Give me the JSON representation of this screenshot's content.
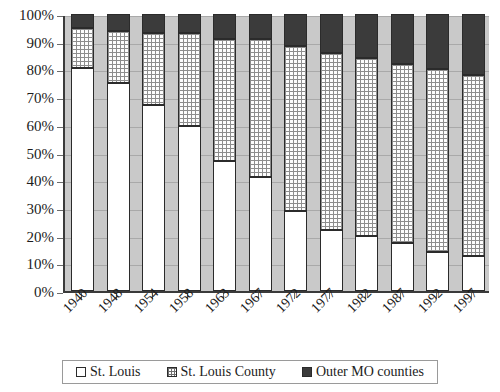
{
  "chart_data": {
    "type": "bar",
    "stacked": true,
    "stacked_mode": "percent",
    "title": "",
    "subtitle": "",
    "xlabel": "",
    "ylabel": "",
    "ylim": [
      0,
      100
    ],
    "ytick_labels": [
      "0%",
      "10%",
      "20%",
      "30%",
      "40%",
      "50%",
      "60%",
      "70%",
      "80%",
      "90%",
      "100%"
    ],
    "ytick_values": [
      0,
      10,
      20,
      30,
      40,
      50,
      60,
      70,
      80,
      90,
      100
    ],
    "grid": true,
    "legend_position": "bottom",
    "categories": [
      "1940",
      "1948",
      "1954",
      "1958",
      "1963",
      "1967",
      "1972",
      "1977",
      "1982",
      "1987",
      "1992",
      "1997"
    ],
    "series": [
      {
        "name": "St. Louis",
        "fill": "white",
        "color": "#ffffff",
        "values": [
          80.5,
          75.0,
          67.0,
          59.5,
          47.0,
          41.0,
          29.0,
          22.0,
          20.0,
          17.5,
          14.0,
          12.5
        ]
      },
      {
        "name": "St. Louis County",
        "fill": "grid",
        "color": "#fdfdfd",
        "values": [
          14.5,
          19.0,
          26.0,
          33.5,
          44.0,
          50.0,
          59.5,
          64.0,
          64.0,
          64.5,
          66.0,
          65.5
        ]
      },
      {
        "name": "Outer MO counties",
        "fill": "solid-dark",
        "color": "#3b3b3b",
        "values": [
          5.0,
          6.0,
          7.0,
          7.0,
          9.0,
          9.0,
          11.5,
          14.0,
          16.0,
          18.0,
          20.0,
          22.0
        ]
      }
    ]
  },
  "axes": {
    "y_ticks": [
      {
        "label": "0%",
        "value": 0
      },
      {
        "label": "10%",
        "value": 10
      },
      {
        "label": "20%",
        "value": 20
      },
      {
        "label": "30%",
        "value": 30
      },
      {
        "label": "40%",
        "value": 40
      },
      {
        "label": "50%",
        "value": 50
      },
      {
        "label": "60%",
        "value": 60
      },
      {
        "label": "70%",
        "value": 70
      },
      {
        "label": "80%",
        "value": 80
      },
      {
        "label": "90%",
        "value": 90
      },
      {
        "label": "100%",
        "value": 100
      }
    ],
    "x_ticks": [
      "1940",
      "1948",
      "1954",
      "1958",
      "1963",
      "1967",
      "1972",
      "1977",
      "1982",
      "1987",
      "1992",
      "1997"
    ]
  },
  "legend": {
    "items": [
      {
        "label": "St. Louis",
        "swatch": "white-square-icon"
      },
      {
        "label": "St. Louis County",
        "swatch": "grid-square-icon"
      },
      {
        "label": "Outer MO counties",
        "swatch": "dark-square-icon"
      }
    ]
  },
  "colors": {
    "plot_background": "#c9c9c9",
    "axis_line": "#3a3a3a",
    "gridline": "#a9a9a9",
    "series_1": "#ffffff",
    "series_2": "#fdfdfd",
    "series_3": "#3b3b3b",
    "text": "#1c1c1c",
    "page_background": "#ffffff"
  }
}
